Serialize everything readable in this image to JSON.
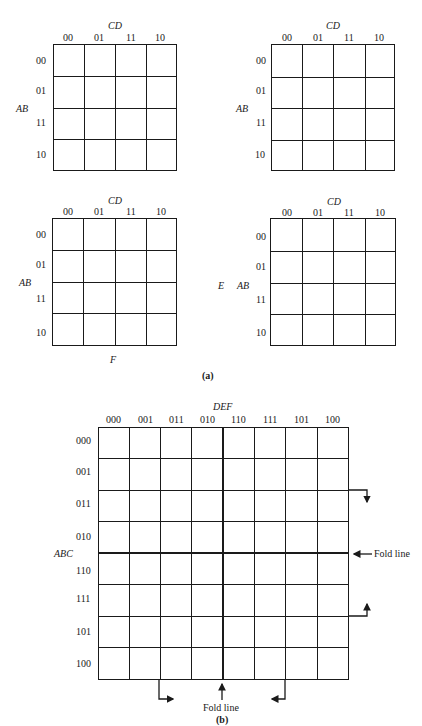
{
  "figure": {
    "part_a_caption": "(a)",
    "part_b_caption": "(b)"
  },
  "maps_a": [
    {
      "id": "map-a1",
      "col_var": "CD",
      "row_var": "AB",
      "col_labels": [
        "00",
        "01",
        "11",
        "10"
      ],
      "row_labels": [
        "00",
        "01",
        "11",
        "10"
      ],
      "box": {
        "left": 53,
        "top": 44,
        "width": 124,
        "height": 127
      }
    },
    {
      "id": "map-a2",
      "col_var": "CD",
      "row_var": "AB",
      "col_labels": [
        "00",
        "01",
        "11",
        "10"
      ],
      "row_labels": [
        "00",
        "01",
        "11",
        "10"
      ],
      "box": {
        "left": 271,
        "top": 44,
        "width": 124,
        "height": 127
      }
    },
    {
      "id": "map-a3",
      "col_var": "CD",
      "row_var": "AB",
      "col_labels": [
        "00",
        "01",
        "11",
        "10"
      ],
      "row_labels": [
        "00",
        "01",
        "11",
        "10"
      ],
      "box": {
        "left": 52,
        "top": 218,
        "width": 125,
        "height": 128
      },
      "below_label": "F"
    },
    {
      "id": "map-a4",
      "col_var": "CD",
      "row_var": "AB",
      "col_labels": [
        "00",
        "01",
        "11",
        "10"
      ],
      "row_labels": [
        "00",
        "01",
        "11",
        "10"
      ],
      "box": {
        "left": 270,
        "top": 218,
        "width": 126,
        "height": 128
      },
      "side_label": "E"
    }
  ],
  "map_b": {
    "col_var": "DEF",
    "row_var": "ABC",
    "col_labels": [
      "000",
      "001",
      "011",
      "010",
      "110",
      "111",
      "101",
      "100"
    ],
    "row_labels": [
      "000",
      "001",
      "011",
      "010",
      "110",
      "111",
      "101",
      "100"
    ],
    "box": {
      "left": 98,
      "top": 427,
      "width": 251,
      "height": 253
    },
    "fold_line_right_label": "Fold line",
    "fold_line_bottom_label": "Fold line"
  }
}
